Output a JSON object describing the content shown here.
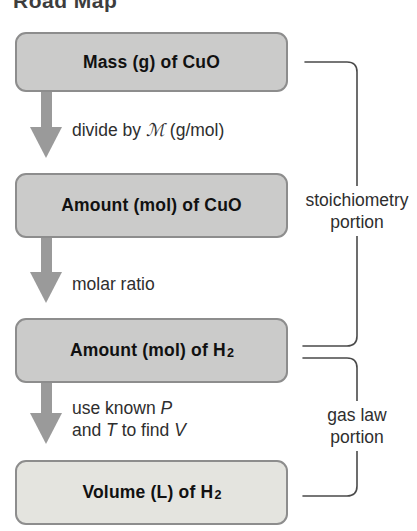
{
  "title": "Road Map",
  "boxes": [
    {
      "label": "Mass (g) of CuO",
      "sub": ""
    },
    {
      "label": "Amount (mol) of CuO",
      "sub": ""
    },
    {
      "label": "Amount (mol) of H",
      "sub": "2"
    },
    {
      "label": "Volume (L) of H",
      "sub": "2"
    }
  ],
  "arrows": [
    {
      "pre": "divide by",
      "symbol": "ℳ",
      "post": "(g/mol)"
    },
    {
      "label": "molar ratio"
    },
    {
      "line1_pre": "use known",
      "line1_var": "P",
      "line2_pre": "and",
      "line2_var": "T",
      "line2_mid": "to find",
      "line2_var2": "V"
    }
  ],
  "side_labels": [
    {
      "line1": "stoichiometry",
      "line2": "portion"
    },
    {
      "line1": "gas law",
      "line2": "portion"
    }
  ],
  "colors": {
    "box_fill": "#cbcbca",
    "box_fill_highlight": "#e4e4df",
    "box_border": "#8d8d8d",
    "arrow": "#9a9a9a",
    "bracket_line": "#4a4a4a",
    "text": "#111111",
    "title_text": "#3d3d3d"
  }
}
